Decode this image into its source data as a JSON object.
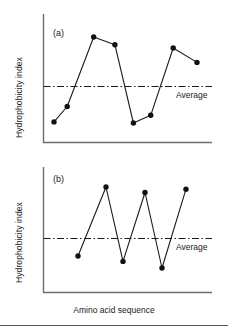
{
  "figure": {
    "xlabel": "Amino acid sequence",
    "panels": [
      {
        "tag": "(a)",
        "ylabel": "Hydrophobicity index",
        "average_label": "Average"
      },
      {
        "tag": "(b)",
        "ylabel": "Hydrophobicity index",
        "average_label": "Average"
      }
    ]
  },
  "chart_data": [
    {
      "type": "line",
      "title": "(a)",
      "xlabel": "Amino acid sequence",
      "ylabel": "Hydrophobicity index",
      "grid": false,
      "legend": null,
      "xlim": [
        0,
        10
      ],
      "ylim": [
        0,
        10
      ],
      "marker": "filled-circle",
      "line_color": "#1a1a1a",
      "average_line": {
        "label": "Average",
        "value": 5.0,
        "style": "dash-dot",
        "color": "#1a1a1a"
      },
      "series": [
        {
          "name": "hydrophobicity-a",
          "x": [
            1,
            2,
            4,
            5.6,
            7,
            8.3,
            10,
            11.8
          ],
          "values": [
            1.6,
            3.0,
            9.3,
            8.6,
            1.5,
            2.2,
            8.3,
            7.0
          ]
        }
      ]
    },
    {
      "type": "line",
      "title": "(b)",
      "xlabel": "Amino acid sequence",
      "ylabel": "Hydrophobicity index",
      "grid": false,
      "legend": null,
      "xlim": [
        0,
        10
      ],
      "ylim": [
        0,
        10
      ],
      "marker": "filled-circle",
      "line_color": "#1a1a1a",
      "average_line": {
        "label": "Average",
        "value": 5.0,
        "style": "dash-dot",
        "color": "#1a1a1a"
      },
      "series": [
        {
          "name": "hydrophobicity-b",
          "x": [
            2.4,
            5.2,
            6.9,
            9.1,
            10.8,
            13.2
          ],
          "values": [
            3.2,
            9.5,
            2.7,
            9.0,
            2.1,
            9.3
          ]
        }
      ]
    }
  ]
}
